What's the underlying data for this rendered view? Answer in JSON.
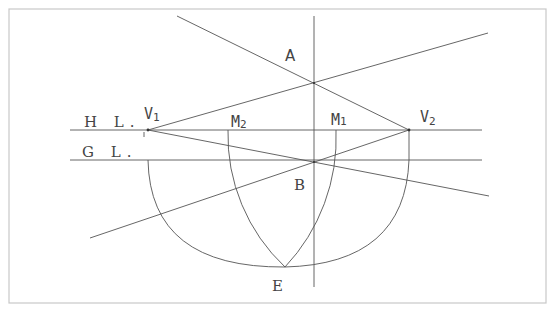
{
  "diagram": {
    "type": "two-point perspective construction",
    "colors": {
      "frame": "#c8c8c8",
      "line": "#555555",
      "text": "#444444",
      "background": "#ffffff"
    },
    "labels": {
      "horizon_line": "H L.",
      "ground_line": "G L.",
      "vp_left": "V",
      "vp_left_sub": "1",
      "vp_right": "V",
      "vp_right_sub": "2",
      "measure_left": "M",
      "measure_left_sub": "2",
      "measure_right": "M",
      "measure_right_sub": "1",
      "point_a": "A",
      "point_b": "B",
      "point_e": "E"
    },
    "points": {
      "V1": [
        148,
        130
      ],
      "V2": [
        409,
        130
      ],
      "M1": [
        336,
        130
      ],
      "M2": [
        228,
        130
      ],
      "A": [
        314,
        83
      ],
      "B": [
        314,
        162
      ],
      "E": [
        285,
        267
      ]
    }
  }
}
